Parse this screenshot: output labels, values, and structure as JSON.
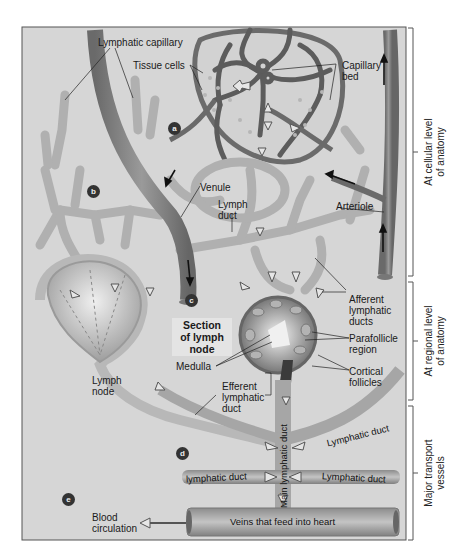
{
  "figure": {
    "step_badges": [
      "a",
      "b",
      "c",
      "d",
      "e"
    ],
    "labels": {
      "lymphatic_capillary": "Lymphatic capillary",
      "tissue_cells": "Tissue cells",
      "capillary_bed": [
        "Capillary",
        "bed"
      ],
      "venule": "Venule",
      "lymph_duct": [
        "Lymph",
        "duct"
      ],
      "arteriole": "Arteriole",
      "afferent_lymphatic_ducts": [
        "Afferent",
        "lymphatic",
        "ducts"
      ],
      "section_of_lymph_node": [
        "Section",
        "of lymph",
        "node"
      ],
      "parafollicle_region": [
        "Parafollicle",
        "region"
      ],
      "medulla": "Medulla",
      "cortical_follicles": [
        "Cortical",
        "follicles"
      ],
      "lymph_node": [
        "Lymph",
        "node"
      ],
      "efferent_lymphatic_duct": [
        "Efferent",
        "lymphatic",
        "duct"
      ],
      "main_lymphatic_duct": "Main lymphatic duct",
      "lymphatic_duct_upper_right": "Lymphatic duct",
      "lymphatic_duct_lower_left": "lymphatic duct",
      "lymphatic_duct_lower_right": "Lymphatic duct",
      "blood_circulation": [
        "Blood",
        "circulation"
      ],
      "veins_feed_heart": "Veins that feed into heart"
    },
    "side_brackets": [
      {
        "lines": [
          "At cellular level",
          "of anatomy"
        ]
      },
      {
        "lines": [
          "At regional level",
          "of anatomy"
        ]
      },
      {
        "lines": [
          "Major transport",
          "vessels"
        ]
      }
    ],
    "colors": {
      "background": "#d6d6d6",
      "vessel": "#8a8a8a",
      "vessel_dark": "#5e5e5e",
      "lymph": "#b9b9b9",
      "badge": "#333333"
    }
  }
}
